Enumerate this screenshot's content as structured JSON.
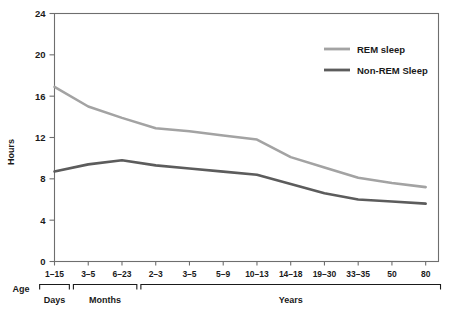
{
  "chart_data": {
    "type": "line",
    "title": "",
    "xlabel": "Age",
    "ylabel": "Hours",
    "ylim": [
      0,
      24
    ],
    "yticks": [
      0,
      4,
      8,
      12,
      16,
      20,
      24
    ],
    "ytick_labels": [
      "0",
      "4",
      "8",
      "12",
      "16",
      "20",
      "24"
    ],
    "grid": false,
    "legend_position": "top-right",
    "categories": [
      "1–15",
      "3–5",
      "6–23",
      "2–3",
      "3–5",
      "5–9",
      "10–13",
      "14–18",
      "19–30",
      "33–35",
      "50",
      "80"
    ],
    "category_groups": [
      {
        "label": "Days",
        "start_index": 0,
        "end_index": 0
      },
      {
        "label": "Months",
        "start_index": 1,
        "end_index": 2
      },
      {
        "label": "Years",
        "start_index": 3,
        "end_index": 11
      }
    ],
    "series": [
      {
        "name": "REM sleep",
        "color": "#a3a3a3",
        "values": [
          16.9,
          15.0,
          13.9,
          12.9,
          12.6,
          12.2,
          11.8,
          10.1,
          9.1,
          8.1,
          7.6,
          7.2
        ]
      },
      {
        "name": "Non-REM Sleep",
        "color": "#5c5c5c",
        "values": [
          8.7,
          9.4,
          9.8,
          9.3,
          9.0,
          8.7,
          8.4,
          7.5,
          6.6,
          6.0,
          5.8,
          5.6
        ]
      }
    ]
  },
  "legend": {
    "items": [
      {
        "label": "REM sleep",
        "color": "#a3a3a3"
      },
      {
        "label": "Non-REM Sleep",
        "color": "#5c5c5c"
      }
    ]
  },
  "axes": {
    "y_title": "Hours",
    "x_title": "Age"
  },
  "colors": {
    "rem": "#a3a3a3",
    "non_rem": "#5c5c5c",
    "frame": "#6e6e6e",
    "text": "#1a1a1a",
    "background": "#ffffff"
  }
}
